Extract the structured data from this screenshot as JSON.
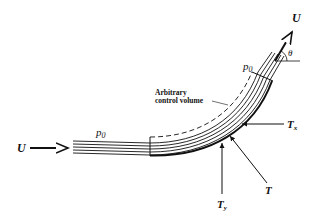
{
  "diagram": {
    "labels": {
      "inlet_velocity": "U",
      "outlet_velocity": "U",
      "angle": "θ",
      "pressure_inlet": "p",
      "pressure_inlet_sub": "0",
      "pressure_outlet": "p",
      "pressure_outlet_sub": "0",
      "control_volume_line1": "Arbitrary",
      "control_volume_line2": "control volume",
      "force_x": "T",
      "force_x_sub": "x",
      "force_y": "T",
      "force_y_sub": "y",
      "force_total": "T"
    },
    "colors": {
      "line": "#111111",
      "background": "#ffffff"
    }
  }
}
